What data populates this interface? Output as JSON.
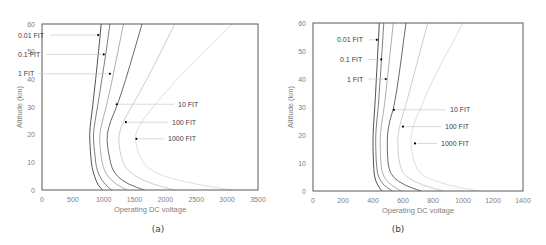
{
  "chart_data": [
    {
      "type": "line",
      "panel": "(a)",
      "caption": "(a)",
      "title": "",
      "xlabel": "Operating DC voltage",
      "ylabel": "Altitude (km)",
      "xlim": [
        0,
        3500
      ],
      "ylim": [
        0,
        60
      ],
      "xticks": [
        0,
        500,
        1000,
        1500,
        2000,
        2500,
        3000,
        3500
      ],
      "yticks": [
        0,
        10,
        20,
        30,
        40,
        50,
        60
      ],
      "grid": false,
      "legend": "inline annotations with leader arrows",
      "y": [
        0,
        2,
        5,
        8,
        12,
        16,
        20,
        25,
        30,
        40,
        50,
        60
      ],
      "series": [
        {
          "name": "0.01 FIT",
          "color": "#404040",
          "values": [
            980,
            900,
            850,
            810,
            790,
            780,
            770,
            790,
            820,
            870,
            915,
            960
          ],
          "marker": {
            "x": 910,
            "y": 56
          }
        },
        {
          "name": "0.1 FIT",
          "color": "#707070",
          "values": [
            1130,
            1020,
            930,
            880,
            860,
            840,
            830,
            860,
            900,
            970,
            1040,
            1100
          ],
          "marker": {
            "x": 1000,
            "y": 49
          }
        },
        {
          "name": "1 FIT",
          "color": "#a6a6a6",
          "values": [
            1380,
            1200,
            1060,
            990,
            960,
            940,
            930,
            980,
            1040,
            1140,
            1230,
            1320
          ],
          "marker": {
            "x": 1100,
            "y": 42
          }
        },
        {
          "name": "10 FIT",
          "color": "#595959",
          "values": [
            1660,
            1400,
            1210,
            1130,
            1090,
            1060,
            1050,
            1110,
            1210,
            1360,
            1490,
            1620
          ],
          "marker": {
            "x": 1210,
            "y": 31
          }
        },
        {
          "name": "100 FIT",
          "color": "#c8c8c8",
          "values": [
            2150,
            1800,
            1500,
            1350,
            1280,
            1250,
            1240,
            1320,
            1450,
            1700,
            1930,
            2150
          ],
          "marker": {
            "x": 1360,
            "y": 24.5
          }
        },
        {
          "name": "1000 FIT",
          "color": "#dadada",
          "values": [
            3080,
            2500,
            1950,
            1700,
            1580,
            1530,
            1500,
            1620,
            1800,
            2180,
            2620,
            3080
          ],
          "marker": {
            "x": 1530,
            "y": 18.5
          }
        }
      ],
      "annotations": [
        {
          "text": "0.01 FIT",
          "y": 56
        },
        {
          "text": "0.1 FIT",
          "y": 49
        },
        {
          "text": "1 FIT",
          "y": 42
        },
        {
          "text": "10 FIT",
          "y": 31
        },
        {
          "text": "100 FIT",
          "y": 24.5
        },
        {
          "text": "1000 FIT",
          "y": 18.5
        }
      ]
    },
    {
      "type": "line",
      "panel": "(b)",
      "caption": "(b)",
      "title": "",
      "xlabel": "Operating DC voltage",
      "ylabel": "Altitude (km)",
      "xlim": [
        0,
        1400
      ],
      "ylim": [
        0,
        60
      ],
      "xticks": [
        0,
        200,
        400,
        600,
        800,
        1000,
        1200,
        1400
      ],
      "yticks": [
        0,
        10,
        20,
        30,
        40,
        50,
        60
      ],
      "grid": false,
      "legend": "inline annotations with leader arrows",
      "y": [
        0,
        2,
        5,
        8,
        12,
        16,
        20,
        25,
        30,
        40,
        50,
        60
      ],
      "series": [
        {
          "name": "0.01 FIT",
          "color": "#404040",
          "values": [
            460,
            430,
            410,
            405,
            402,
            400,
            400,
            405,
            412,
            422,
            432,
            442
          ],
          "marker": {
            "x": 425,
            "y": 54
          }
        },
        {
          "name": "0.1 FIT",
          "color": "#707070",
          "values": [
            530,
            470,
            435,
            425,
            420,
            418,
            418,
            425,
            435,
            448,
            460,
            472
          ],
          "marker": {
            "x": 455,
            "y": 47
          }
        },
        {
          "name": "1 FIT",
          "color": "#a6a6a6",
          "values": [
            590,
            520,
            470,
            455,
            450,
            448,
            448,
            460,
            475,
            495,
            515,
            535
          ],
          "marker": {
            "x": 485,
            "y": 40
          }
        },
        {
          "name": "10 FIT",
          "color": "#595959",
          "values": [
            720,
            610,
            530,
            505,
            497,
            495,
            495,
            510,
            540,
            570,
            595,
            620
          ],
          "marker": {
            "x": 540,
            "y": 29
          }
        },
        {
          "name": "100 FIT",
          "color": "#c8c8c8",
          "values": [
            870,
            730,
            620,
            585,
            570,
            565,
            565,
            585,
            615,
            665,
            715,
            765
          ],
          "marker": {
            "x": 600,
            "y": 23
          }
        },
        {
          "name": "1000 FIT",
          "color": "#dadada",
          "values": [
            1100,
            900,
            740,
            690,
            665,
            655,
            650,
            680,
            720,
            800,
            900,
            1000
          ],
          "marker": {
            "x": 680,
            "y": 17
          }
        }
      ],
      "annotations": [
        {
          "text": "0.01 FIT",
          "y": 54
        },
        {
          "text": "0.1 FIT",
          "y": 47
        },
        {
          "text": "1 FIT",
          "y": 40
        },
        {
          "text": "10 FIT",
          "y": 29
        },
        {
          "text": "100 FIT",
          "y": 23
        },
        {
          "text": "1000 FIT",
          "y": 17
        }
      ]
    }
  ],
  "layout": {
    "panels": [
      {
        "left": 42,
        "right": 258,
        "top": 24,
        "bottom": 190,
        "label_side": [
          [
            "left",
            0
          ],
          [
            "left",
            1
          ],
          [
            "left",
            2
          ],
          [
            "right",
            3
          ],
          [
            "right",
            4
          ],
          [
            "right",
            5
          ]
        ],
        "label_x": [
          18,
          18,
          18,
          178,
          172,
          168
        ],
        "caption_x": 158
      },
      {
        "left": 313,
        "right": 523,
        "top": 23,
        "bottom": 191,
        "label_side": [
          [
            "left",
            0
          ],
          [
            "left",
            1
          ],
          [
            "left",
            2
          ],
          [
            "right",
            3
          ],
          [
            "right",
            4
          ],
          [
            "right",
            5
          ]
        ],
        "label_x": [
          337,
          340,
          347,
          450,
          445,
          441
        ],
        "caption_x": 398
      }
    ]
  }
}
